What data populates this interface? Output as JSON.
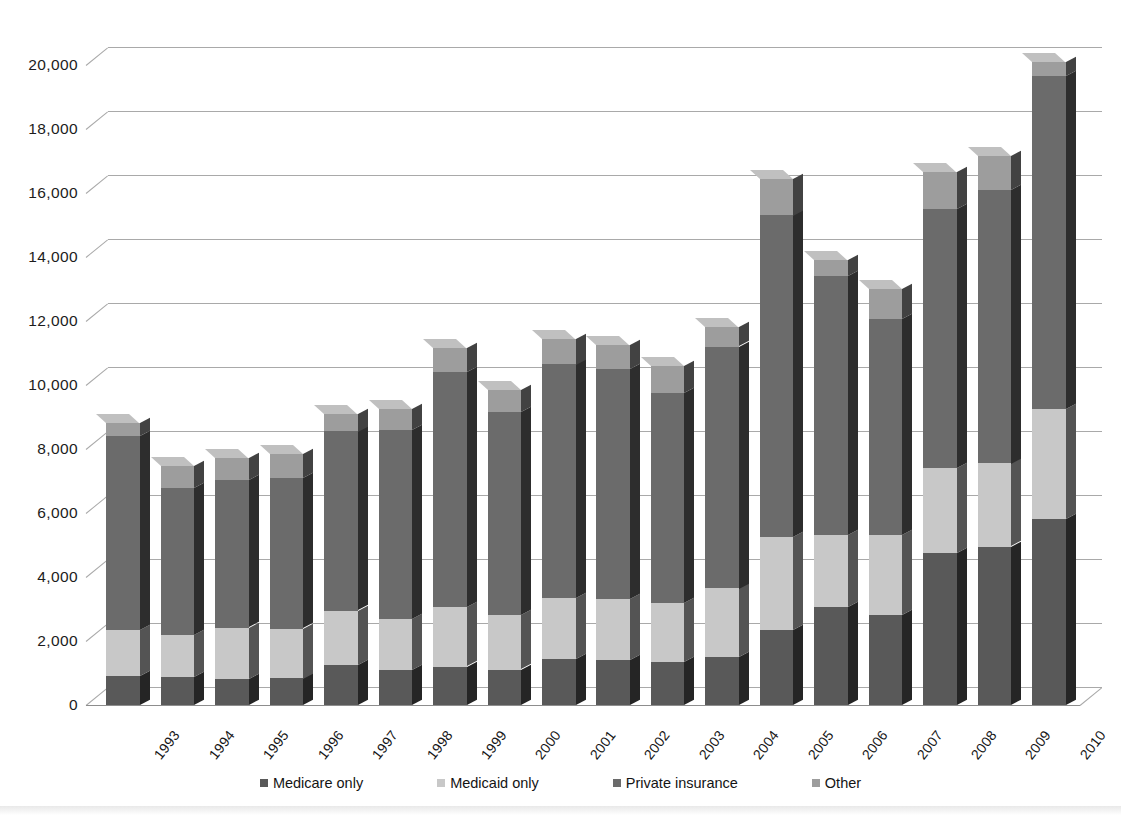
{
  "chart_data": {
    "type": "bar",
    "stacked": true,
    "title": "",
    "subtitle": "",
    "xlabel": "",
    "ylabel": "",
    "ylim": [
      0,
      20000
    ],
    "ytick_step": 2000,
    "ytick_labels": [
      "20,000",
      "18,000",
      "16,000",
      "14,000",
      "12,000",
      "10,000",
      "8,000",
      "6,000",
      "4,000",
      "2,000",
      "0"
    ],
    "ytick_values": [
      20000,
      18000,
      16000,
      14000,
      12000,
      10000,
      8000,
      6000,
      4000,
      2000,
      0
    ],
    "grid": true,
    "legend_position": "bottom",
    "categories": [
      "1993",
      "1994",
      "1995",
      "1996",
      "1997",
      "1998",
      "1999",
      "2000",
      "2001",
      "2002",
      "2003",
      "2004",
      "2005",
      "2006",
      "2007",
      "2008",
      "2009",
      "2010"
    ],
    "series": [
      {
        "name": "Medicare only",
        "color": "#595959",
        "values": [
          900,
          880,
          820,
          840,
          1250,
          1100,
          1200,
          1100,
          1450,
          1400,
          1350,
          1500,
          2350,
          3050,
          2800,
          4750,
          4950,
          5800
        ]
      },
      {
        "name": "Medicaid only",
        "color": "#c8c8c8",
        "values": [
          1450,
          1300,
          1600,
          1550,
          1700,
          1600,
          1850,
          1700,
          1900,
          1900,
          1850,
          2150,
          2900,
          2250,
          2500,
          2650,
          2600,
          3450
        ]
      },
      {
        "name": "Private insurance",
        "color": "#6b6b6b",
        "values": [
          6050,
          4600,
          4600,
          4700,
          5600,
          5900,
          7350,
          6350,
          7300,
          7200,
          6550,
          7550,
          10050,
          8100,
          6750,
          8100,
          8550,
          10400
        ]
      },
      {
        "name": "Other",
        "color": "#9d9d9d",
        "values": [
          400,
          700,
          700,
          750,
          550,
          650,
          750,
          700,
          800,
          750,
          850,
          600,
          1150,
          500,
          950,
          1150,
          1050,
          450
        ]
      }
    ],
    "totals": [
      8800,
      7480,
      7720,
      7840,
      9100,
      9250,
      11150,
      9850,
      11450,
      11250,
      10600,
      11800,
      16450,
      13900,
      13000,
      16650,
      17150,
      20100
    ]
  },
  "legend": {
    "items": [
      {
        "label": "Medicare only",
        "color": "#595959"
      },
      {
        "label": "Medicaid only",
        "color": "#c8c8c8"
      },
      {
        "label": "Private insurance",
        "color": "#6b6b6b"
      },
      {
        "label": "Other",
        "color": "#9d9d9d"
      }
    ]
  }
}
